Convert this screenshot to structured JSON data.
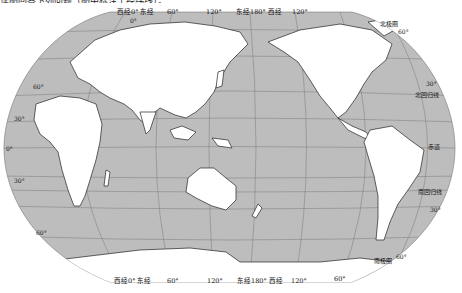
{
  "caption_fragment": "读图回答下列问题（图中标注了经纬线）。",
  "map": {
    "title": "以太平洋为中心的世界地图",
    "colors": {
      "ocean": "#bdbdbd",
      "land": "#ffffff",
      "coast": "#222222",
      "graticule": "#7a7a7a",
      "background": "#ffffff"
    },
    "top_labels": [
      {
        "text": "西经0° 东经",
        "x": 117,
        "y": 13
      },
      {
        "text": "0°",
        "x": 130,
        "y": 20
      },
      {
        "text": "60°",
        "x": 167,
        "y": 13
      },
      {
        "text": "120°",
        "x": 206,
        "y": 13
      },
      {
        "text": "东经180° 西经",
        "x": 236,
        "y": 13
      },
      {
        "text": "120°",
        "x": 292,
        "y": 13
      }
    ],
    "bottom_labels": [
      {
        "text": "西经0° 东经",
        "x": 114,
        "y": 281
      },
      {
        "text": "60°",
        "x": 167,
        "y": 281
      },
      {
        "text": "120°",
        "x": 207,
        "y": 281
      },
      {
        "text": "东经180° 西经",
        "x": 237,
        "y": 281
      },
      {
        "text": "120°",
        "x": 291,
        "y": 281
      },
      {
        "text": "60°",
        "x": 334,
        "y": 279
      }
    ],
    "latitude_labels": [
      {
        "text": "60°",
        "x": 33,
        "y": 86
      },
      {
        "text": "30°",
        "x": 14,
        "y": 118
      },
      {
        "text": "0°",
        "x": 6,
        "y": 148
      },
      {
        "text": "30°",
        "x": 14,
        "y": 180
      },
      {
        "text": "60°",
        "x": 36,
        "y": 232
      },
      {
        "text": "60°",
        "x": 398,
        "y": 31
      },
      {
        "text": "30°",
        "x": 426,
        "y": 83
      },
      {
        "text": "30°",
        "x": 430,
        "y": 209
      },
      {
        "text": "60°",
        "x": 396,
        "y": 256
      }
    ],
    "feature_labels": [
      {
        "name": "arctic-circle-label",
        "text": "北极圈",
        "x": 380,
        "y": 23
      },
      {
        "name": "tropic-of-cancer-label",
        "text": "北回归线",
        "x": 415,
        "y": 94
      },
      {
        "name": "equator-label",
        "text": "赤道",
        "x": 428,
        "y": 146
      },
      {
        "name": "tropic-of-capricorn-label",
        "text": "南回归线",
        "x": 418,
        "y": 191
      },
      {
        "name": "antarctic-circle-label",
        "text": "南极圈",
        "x": 374,
        "y": 260
      }
    ]
  }
}
